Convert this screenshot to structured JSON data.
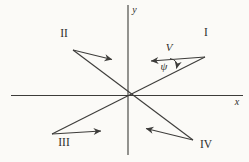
{
  "figure": {
    "background": "#fbfaf7",
    "ink": "#3d3c3a",
    "axes": [
      {
        "name": "x-axis",
        "x1": 11,
        "y1": 95.5,
        "x2": 243,
        "y2": 95.5
      },
      {
        "name": "y-axis",
        "x1": 128,
        "y1": 5,
        "x2": 128,
        "y2": 155
      }
    ],
    "diagonals": [
      {
        "name": "diagonal-line-iii-to-i",
        "x1": 52,
        "y1": 134,
        "x2": 205,
        "y2": 57
      },
      {
        "name": "diagonal-line-ii-to-iv",
        "x1": 73,
        "y1": 50,
        "x2": 193,
        "y2": 140
      }
    ],
    "vectors": [
      {
        "name": "vector-arrow-quadrant-i",
        "x1": 205,
        "y1": 57,
        "x2": 151,
        "y2": 61
      },
      {
        "name": "vector-arrow-quadrant-ii",
        "x1": 73,
        "y1": 50,
        "x2": 112,
        "y2": 59.5
      },
      {
        "name": "vector-arrow-quadrant-iii",
        "x1": 52,
        "y1": 134,
        "x2": 101,
        "y2": 131
      },
      {
        "name": "vector-arrow-quadrant-iv",
        "x1": 193,
        "y1": 140,
        "x2": 146,
        "y2": 128.5
      }
    ],
    "angle_arc": {
      "name": "angle-arc",
      "path": "M 170 58.5 Q 178.5 60 176.5 68.5"
    },
    "labels": [
      {
        "name": "axis-label-y",
        "text": "y",
        "x": 134.5,
        "y": 13,
        "kind": "axis"
      },
      {
        "name": "axis-label-x",
        "text": "x",
        "x": 237,
        "y": 105,
        "kind": "axis"
      },
      {
        "name": "quadrant-label-i",
        "text": "I",
        "x": 206,
        "y": 36,
        "kind": "quadrant"
      },
      {
        "name": "quadrant-label-ii",
        "text": "II",
        "x": 64,
        "y": 37,
        "kind": "quadrant"
      },
      {
        "name": "quadrant-label-iii",
        "text": "III",
        "x": 64,
        "y": 146,
        "kind": "quadrant"
      },
      {
        "name": "quadrant-label-iv",
        "text": "IV",
        "x": 206,
        "y": 148,
        "kind": "quadrant"
      },
      {
        "name": "vector-label-v",
        "text": "V",
        "x": 169,
        "y": 51,
        "kind": "vector"
      },
      {
        "name": "angle-label-psi",
        "text": "ψ",
        "x": 164,
        "y": 70,
        "kind": "angle"
      }
    ]
  }
}
